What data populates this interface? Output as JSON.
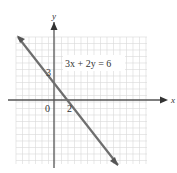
{
  "chart_data": {
    "type": "line",
    "title": "",
    "equation_label": "3x + 2y = 6",
    "xlabel": "x",
    "ylabel": "y",
    "tick_labels": {
      "origin": "0",
      "x_intercept": "2",
      "y_intercept": "3"
    },
    "series": [
      {
        "name": "3x + 2y = 6",
        "x": [
          -3.9,
          7.9
        ],
        "y": [
          8.85,
          -8.85
        ]
      }
    ],
    "intercepts": {
      "x": [
        2,
        0
      ],
      "y": [
        0,
        3
      ]
    },
    "xlim": [
      -4,
      10
    ],
    "ylim": [
      -7,
      7
    ],
    "grid": true,
    "colors": {
      "line": "#6e6e6e",
      "axis": "#555555",
      "grid": "#d8d8d8"
    }
  }
}
